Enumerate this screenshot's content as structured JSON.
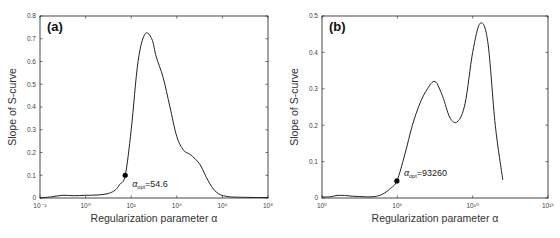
{
  "chart_data": [
    {
      "type": "line",
      "panel_label": "(a)",
      "title": "",
      "xlabel": "Regularization parameter α",
      "ylabel": "Slope of S-curve",
      "xscale": "log",
      "x_tick_labels": [
        "10⁻²",
        "10⁰",
        "10²",
        "10⁴",
        "10⁶",
        "10⁸"
      ],
      "x_tick_exponents": [
        -2,
        0,
        2,
        4,
        6,
        8
      ],
      "y_tick_labels": [
        "0",
        "0.1",
        "0.2",
        "0.3",
        "0.4",
        "0.5",
        "0.6",
        "0.7",
        "0.8"
      ],
      "ylim": [
        0,
        0.8
      ],
      "xlim_log10": [
        -2,
        8
      ],
      "grid": false,
      "series": [
        {
          "name": "Slope of S-curve",
          "x_log10": [
            -2,
            -1.5,
            -1,
            -0.5,
            0,
            0.5,
            1,
            1.3,
            1.5,
            1.74,
            2,
            2.3,
            2.6,
            2.9,
            3.1,
            3.4,
            3.7,
            4,
            4.3,
            4.6,
            5,
            5.3,
            5.6,
            5.9,
            6.2,
            6.5,
            7,
            7.5,
            8
          ],
          "y": [
            0.0,
            0.005,
            0.012,
            0.01,
            0.012,
            0.013,
            0.02,
            0.035,
            0.06,
            0.1,
            0.3,
            0.6,
            0.72,
            0.7,
            0.62,
            0.53,
            0.4,
            0.27,
            0.21,
            0.19,
            0.15,
            0.09,
            0.04,
            0.015,
            0.007,
            0.004,
            0.003,
            0.002,
            0.002
          ]
        }
      ],
      "annotation": {
        "label": "α_opt=54.6",
        "symbol": "α",
        "subscript": "opt",
        "value_text": "=54.6",
        "x": 54.6,
        "y": 0.1
      }
    },
    {
      "type": "line",
      "panel_label": "(b)",
      "title": "",
      "xlabel": "Regularization parameter α",
      "ylabel": "Slope of S-curve",
      "xscale": "log",
      "x_tick_labels": [
        "10⁰",
        "10⁵",
        "10¹⁰",
        "10¹⁵"
      ],
      "x_tick_exponents": [
        0,
        5,
        10,
        15
      ],
      "y_tick_labels": [
        "0",
        "0.1",
        "0.2",
        "0.3",
        "0.4",
        "0.5"
      ],
      "ylim": [
        0,
        0.5
      ],
      "xlim_log10": [
        0,
        15
      ],
      "grid": false,
      "series": [
        {
          "name": "Slope of S-curve",
          "x_log10": [
            0,
            0.5,
            1,
            1.5,
            2,
            2.5,
            3,
            3.5,
            4,
            4.5,
            4.97,
            5.5,
            6,
            6.5,
            7,
            7.5,
            8,
            8.5,
            9,
            9.5,
            10,
            10.5,
            11,
            11.5,
            12
          ],
          "y": [
            0.003,
            0.003,
            0.007,
            0.007,
            0.005,
            0.004,
            0.003,
            0.004,
            0.01,
            0.025,
            0.047,
            0.12,
            0.2,
            0.26,
            0.3,
            0.32,
            0.28,
            0.22,
            0.21,
            0.26,
            0.4,
            0.48,
            0.43,
            0.2,
            0.05
          ]
        }
      ],
      "annotation": {
        "label": "α_opt=93260",
        "symbol": "α",
        "subscript": "opt",
        "value_text": "=93260",
        "x": 93260,
        "y": 0.047
      }
    }
  ]
}
